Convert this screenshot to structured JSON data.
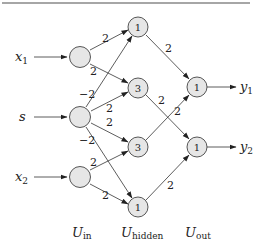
{
  "diagram": {
    "type": "neural-network",
    "inputs": [
      {
        "name": "x",
        "sub": "1"
      },
      {
        "name": "s",
        "sub": ""
      },
      {
        "name": "x",
        "sub": "2"
      }
    ],
    "outputs": [
      {
        "name": "y",
        "sub": "1"
      },
      {
        "name": "y",
        "sub": "2"
      }
    ],
    "layers": [
      {
        "name": "U",
        "sub": "in",
        "thresholds": [
          "",
          "",
          ""
        ]
      },
      {
        "name": "U",
        "sub": "hidden",
        "thresholds": [
          "1",
          "3",
          "3",
          "1"
        ]
      },
      {
        "name": "U",
        "sub": "out",
        "thresholds": [
          "1",
          "1"
        ]
      }
    ],
    "edges": [
      {
        "from": "in0",
        "to": "h0",
        "weight": "2"
      },
      {
        "from": "in0",
        "to": "h1",
        "weight": "2"
      },
      {
        "from": "in1",
        "to": "h0",
        "weight": "−2"
      },
      {
        "from": "in1",
        "to": "h1",
        "weight": "2"
      },
      {
        "from": "in1",
        "to": "h2",
        "weight": "2"
      },
      {
        "from": "in1",
        "to": "h3",
        "weight": "−2"
      },
      {
        "from": "in2",
        "to": "h2",
        "weight": "2"
      },
      {
        "from": "in2",
        "to": "h3",
        "weight": "2"
      },
      {
        "from": "h0",
        "to": "o0",
        "weight": "2"
      },
      {
        "from": "h1",
        "to": "o1",
        "weight": "2"
      },
      {
        "from": "h2",
        "to": "o0",
        "weight": "2"
      },
      {
        "from": "h3",
        "to": "o1",
        "weight": "2"
      }
    ]
  }
}
